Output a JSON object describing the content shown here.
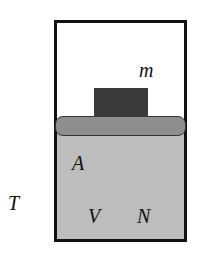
{
  "diagram": {
    "type": "piston-cylinder",
    "colors": {
      "wall": "#111111",
      "gas": "#bdbdbd",
      "piston": "#8e8e8e",
      "mass": "#3a3a3a"
    },
    "labels": {
      "mass": "m",
      "area": "A",
      "volume": "V",
      "particles": "N",
      "temperature": "T"
    }
  }
}
